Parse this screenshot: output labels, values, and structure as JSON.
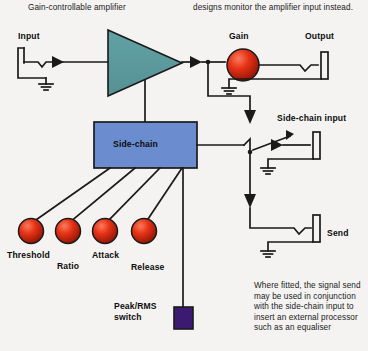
{
  "page": {
    "background": "#f4f3f1",
    "ink": "#1a1a1a"
  },
  "captions": {
    "top_left": "Gain-controllable amplifier",
    "top_right": "designs monitor the amplifier input instead.",
    "bottom_right": "Where fitted, the signal send may be used in conjunction with the side-chain input to insert an external processor such as an equaliser"
  },
  "labels": {
    "input": "Input",
    "gain": "Gain",
    "output": "Output",
    "side_chain_box": "Side-chain",
    "side_chain_input": "Side-chain input",
    "send": "Send",
    "threshold": "Threshold",
    "ratio": "Ratio",
    "attack": "Attack",
    "release": "Release",
    "peak_rms_switch_line1": "Peak/RMS",
    "peak_rms_switch_line2": "switch"
  },
  "colors": {
    "amplifier_triangle": "#5d9b9e",
    "side_chain_box": "#6b8ccf",
    "knob_red": "#e02b16",
    "knob_red_light": "#f4674a",
    "knob_red_dark": "#8f1206",
    "switch_purple": "#3d1a72",
    "wire": "#1a1a1a"
  },
  "controls": [
    {
      "name": "threshold",
      "label": "Threshold"
    },
    {
      "name": "ratio",
      "label": "Ratio"
    },
    {
      "name": "attack",
      "label": "Attack"
    },
    {
      "name": "release",
      "label": "Release"
    }
  ]
}
